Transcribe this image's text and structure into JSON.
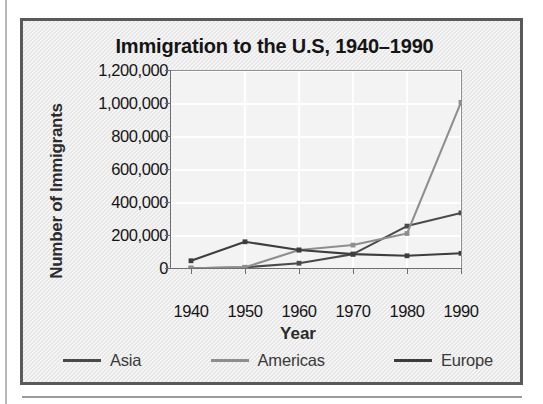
{
  "figure": {
    "title": "Immigration to the U.S, 1940–1990"
  },
  "axes": {
    "x_title": "Year",
    "y_title": "Number of Immigrants"
  },
  "legend": {
    "items": [
      {
        "label": "Asia",
        "color": "#4a4a4a"
      },
      {
        "label": "Americas",
        "color": "#8e8e8e"
      },
      {
        "label": "Europe",
        "color": "#3d3d3d"
      }
    ]
  },
  "chart_data": {
    "type": "line",
    "title": "Immigration to the U.S, 1940–1990",
    "xlabel": "Year",
    "ylabel": "Number of Immigrants",
    "categories": [
      "1940",
      "1950",
      "1960",
      "1970",
      "1980",
      "1990"
    ],
    "x": [
      1940,
      1950,
      1960,
      1970,
      1980,
      1990
    ],
    "xlim": [
      1940,
      1990
    ],
    "ylim": [
      0,
      1200000
    ],
    "ytick_labels": [
      "1,200,000",
      "1,000,000",
      "800,000",
      "600,000",
      "400,000",
      "200,000",
      "0"
    ],
    "ytick_values": [
      1200000,
      1000000,
      800000,
      600000,
      400000,
      200000,
      0
    ],
    "grid": true,
    "legend_position": "bottom",
    "series": [
      {
        "name": "Asia",
        "color": "#4a4a4a",
        "values": [
          5000,
          10000,
          35000,
          90000,
          260000,
          340000
        ]
      },
      {
        "name": "Americas",
        "color": "#8e8e8e",
        "values": [
          5000,
          10000,
          115000,
          145000,
          215000,
          1010000
        ]
      },
      {
        "name": "Europe",
        "color": "#3d3d3d",
        "values": [
          50000,
          165000,
          115000,
          90000,
          80000,
          95000
        ]
      }
    ]
  }
}
